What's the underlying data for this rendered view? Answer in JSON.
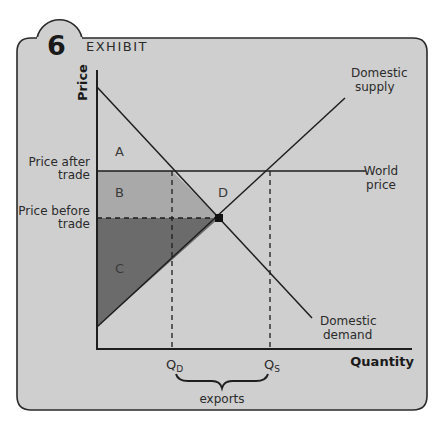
{
  "exhibit": {
    "number": "6",
    "title": "EXHIBIT"
  },
  "axes": {
    "y_label": "Price",
    "x_label": "Quantity"
  },
  "price_labels": {
    "after_line1": "Price after",
    "after_line2": "trade",
    "before_line1": "Price before",
    "before_line2": "trade"
  },
  "curves": {
    "supply_line1": "Domestic",
    "supply_line2": "supply",
    "demand_line1": "Domestic",
    "demand_line2": "demand",
    "world_line1": "World",
    "world_line2": "price"
  },
  "regions": {
    "a": "A",
    "b": "B",
    "c": "C",
    "d": "D"
  },
  "quantities": {
    "qd_main": "Q",
    "qd_sub": "D",
    "qs_main": "Q",
    "qs_sub": "S"
  },
  "brace_label": "exports",
  "colors": {
    "panel": "#cfcfcf",
    "region_b": "#a9a9a9",
    "region_c": "#6b6b6b",
    "line": "#1e1e1e"
  }
}
